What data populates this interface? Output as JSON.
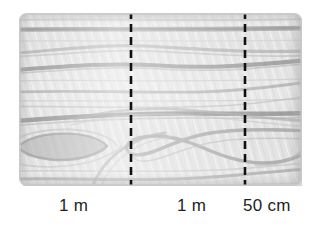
{
  "diagram": {
    "board": {
      "name": "wooden-board",
      "base_color": "#e2e2e2",
      "grain_color": "#9a9a9a",
      "edge_color": "#c2c2c2",
      "shadow_color": "#d8d8d8",
      "corner_radius_px": 7
    },
    "divider_lines": [
      {
        "name": "divider-line-1",
        "color": "#111111",
        "style": "dashed",
        "x_px": 131,
        "dash_length_px": 8,
        "gap_length_px": 5,
        "thickness_px": 2.6
      },
      {
        "name": "divider-line-2",
        "color": "#111111",
        "style": "dashed",
        "x_px": 245,
        "dash_length_px": 8,
        "gap_length_px": 5,
        "thickness_px": 2.6
      }
    ],
    "measurements": [
      {
        "id": "segment-1",
        "label": "1 m",
        "value": 1,
        "unit": "m"
      },
      {
        "id": "segment-2",
        "label": "1 m",
        "value": 1,
        "unit": "m"
      },
      {
        "id": "segment-3",
        "label": "50 cm",
        "value": 50,
        "unit": "cm"
      }
    ],
    "label_color": "#231f20"
  }
}
